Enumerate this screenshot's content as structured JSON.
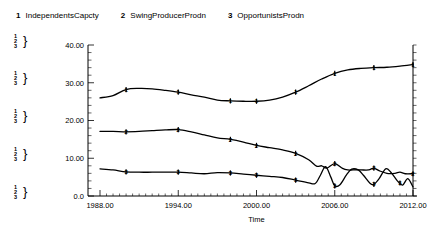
{
  "legend": {
    "entries": [
      {
        "key": "1",
        "label": "IndependentsCapcty"
      },
      {
        "key": "2",
        "label": "SwingProducerProdn"
      },
      {
        "key": "3",
        "label": "OpportunistsProdn"
      }
    ]
  },
  "scale_markers": [
    {
      "lines": "1 2 3"
    },
    {
      "lines": "1 2 3"
    },
    {
      "lines": "1 2 3"
    },
    {
      "lines": "1 2 3"
    },
    {
      "lines": "1 2 3"
    }
  ],
  "axis": {
    "y_ticks": [
      "40.00",
      "30.00",
      "20.00",
      "10.00",
      "0.0"
    ],
    "x_ticks": [
      "1988.00",
      "1994.00",
      "2000.00",
      "2006.00",
      "2012.00"
    ],
    "x_title": "Time"
  },
  "chart_data": {
    "type": "line",
    "title": "",
    "xlabel": "Time",
    "ylabel": "",
    "xlim": [
      1988,
      2012
    ],
    "ylim": [
      0,
      40
    ],
    "grid": false,
    "legend_position": "top",
    "x_tick_values": [
      1988,
      1994,
      2000,
      2006,
      2012
    ],
    "y_tick_values": [
      0,
      10,
      20,
      30,
      40
    ],
    "series": [
      {
        "name": "IndependentsCapcty",
        "key": "1",
        "marker_label": "1",
        "x": [
          1988,
          1989,
          1990,
          1991,
          1992,
          1993,
          1994,
          1995,
          1996,
          1997,
          1998,
          1999,
          2000,
          2001,
          2002,
          2003,
          2004,
          2005,
          2006,
          2007,
          2008,
          2009,
          2010,
          2011,
          2012
        ],
        "y": [
          26.0,
          26.6,
          28.2,
          28.5,
          28.4,
          28.0,
          27.5,
          26.8,
          26.2,
          25.4,
          25.2,
          25.1,
          25.1,
          25.4,
          26.2,
          27.5,
          29.2,
          31.0,
          32.5,
          33.4,
          33.8,
          34.0,
          34.1,
          34.4,
          34.8
        ],
        "marker_x": [
          1990,
          1994,
          1998,
          2000,
          2003,
          2006,
          2009,
          2012
        ]
      },
      {
        "name": "SwingProducerProdn",
        "key": "2",
        "marker_label": "2",
        "x": [
          1988,
          1989,
          1990,
          1991,
          1992,
          1993,
          1994,
          1995,
          1996,
          1997,
          1998,
          1999,
          2000,
          2001,
          2002,
          2003,
          2004,
          2004.6,
          2005.0,
          2005.4,
          2006.0,
          2006.6,
          2007.0,
          2007.4,
          2008.0,
          2008.6,
          2009.0,
          2009.4,
          2010.0,
          2010.6,
          2011.0,
          2011.4,
          2012.0
        ],
        "y": [
          17.1,
          17.1,
          17.0,
          17.1,
          17.3,
          17.5,
          17.6,
          17.0,
          16.2,
          15.4,
          15.0,
          14.3,
          13.4,
          12.8,
          12.2,
          11.3,
          9.6,
          7.9,
          8.0,
          7.4,
          8.6,
          7.3,
          6.9,
          6.9,
          6.9,
          6.9,
          7.4,
          6.7,
          6.0,
          6.0,
          6.3,
          5.9,
          5.9
        ],
        "marker_x": [
          1990,
          1994,
          1998,
          2000,
          2003,
          2006,
          2009,
          2012
        ]
      },
      {
        "name": "OpportunistsProdn",
        "key": "3",
        "marker_label": "3",
        "x": [
          1988,
          1989,
          1990,
          1991,
          1992,
          1993,
          1994,
          1995,
          1996,
          1997,
          1998,
          1999,
          2000,
          2001,
          2002,
          2003,
          2004,
          2004.5,
          2004.9,
          2005.3,
          2005.7,
          2006.0,
          2006.4,
          2006.9,
          2007.3,
          2007.8,
          2008.2,
          2008.7,
          2009.0,
          2009.4,
          2009.9,
          2010.3,
          2010.8,
          2011.2,
          2011.6,
          2012.0
        ],
        "y": [
          7.2,
          6.9,
          6.4,
          6.3,
          6.3,
          6.3,
          6.3,
          6.1,
          5.9,
          6.2,
          6.1,
          5.8,
          5.5,
          5.2,
          4.9,
          4.2,
          3.5,
          3.3,
          5.5,
          7.8,
          5.0,
          2.7,
          3.0,
          5.6,
          7.1,
          6.9,
          5.5,
          3.4,
          3.1,
          4.6,
          7.2,
          6.3,
          4.0,
          2.9,
          4.6,
          2.4
        ],
        "marker_x": [
          1990,
          1994,
          1998,
          2000,
          2003,
          2006,
          2009,
          2011
        ]
      }
    ]
  }
}
